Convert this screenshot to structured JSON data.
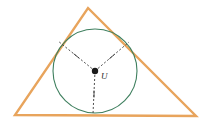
{
  "figure": {
    "name": "incircle-of-triangle",
    "background_color": "#ffffff",
    "width": 207,
    "height": 128
  },
  "triangle": {
    "name": "triangle",
    "stroke_color": "#e8a45c",
    "stroke_width": 2.4,
    "fill": "none",
    "vertices": [
      {
        "name": "apex",
        "x": 88,
        "y": 8
      },
      {
        "name": "bottom-right",
        "x": 196,
        "y": 116
      },
      {
        "name": "bottom-left",
        "x": 15,
        "y": 115
      }
    ]
  },
  "incircle": {
    "name": "incircle",
    "stroke_color": "#3e7f5e",
    "stroke_width": 1.1,
    "fill": "none",
    "center": {
      "x": 95,
      "y": 71
    },
    "radius": 42
  },
  "center_point": {
    "name": "incenter",
    "label": "U",
    "label_x": 101,
    "label_y": 79,
    "marker_color": "#1a1a1a",
    "marker_size": 3.2,
    "x": 95,
    "y": 71
  },
  "radii": [
    {
      "name": "radius-to-left-side",
      "from": {
        "x": 95,
        "y": 71
      },
      "to": {
        "x": 58,
        "y": 41
      },
      "stroke_color": "#3a3a3a",
      "dash": "2,2",
      "tick": {
        "x": 76.5,
        "y": 56,
        "angle": 39,
        "length": 7
      }
    },
    {
      "name": "radius-to-right-side",
      "from": {
        "x": 95,
        "y": 71
      },
      "to": {
        "x": 129,
        "y": 42
      },
      "stroke_color": "#3a3a3a",
      "dash": "2,2",
      "tick": {
        "x": 112,
        "y": 56.5,
        "angle": -40,
        "length": 7
      }
    },
    {
      "name": "radius-to-base",
      "from": {
        "x": 95,
        "y": 71
      },
      "to": {
        "x": 93,
        "y": 114
      },
      "stroke_color": "#3a3a3a",
      "dash": "2,2",
      "tick": {
        "x": 94,
        "y": 94,
        "angle": 90,
        "length": 7
      }
    }
  ],
  "colors": {
    "triangle_orange": "#e8a45c",
    "circle_green": "#3e7f5e",
    "radius_gray": "#3a3a3a",
    "label_black": "#2a2a2a",
    "background_white": "#ffffff"
  }
}
